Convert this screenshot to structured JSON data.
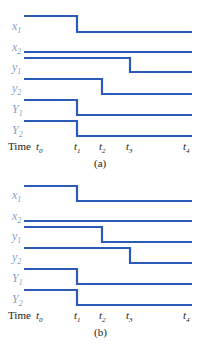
{
  "figure": {
    "line_color": "#2b5bb8",
    "label_color": "#8aa0c8",
    "time_axis_label": "Time",
    "time_ticks": [
      {
        "name": "t",
        "sub": "0",
        "x": 36
      },
      {
        "name": "t",
        "sub": "1",
        "x": 74
      },
      {
        "name": "t",
        "sub": "2",
        "x": 99
      },
      {
        "name": "t",
        "sub": "3",
        "x": 126
      },
      {
        "name": "t",
        "sub": "4",
        "x": 183
      }
    ],
    "x_start": 24,
    "x_end": 192,
    "t_positions": {
      "t1": 77,
      "t2": 102,
      "t3": 130
    }
  },
  "panels": [
    {
      "id": "a",
      "caption": "(a)",
      "top": 0,
      "signals": [
        {
          "label": "x",
          "sub": "1",
          "high_y": 16,
          "low_y": 32,
          "step_x": 77,
          "label_y": 20
        },
        {
          "label": "x",
          "sub": "2",
          "high_y": 52,
          "low_y": 52,
          "step_x": null,
          "label_y": 41
        },
        {
          "label": "y",
          "sub": "1",
          "high_y": 58,
          "low_y": 72,
          "step_x": 130,
          "label_y": 61
        },
        {
          "label": "y",
          "sub": "2",
          "high_y": 79,
          "low_y": 94,
          "step_x": 102,
          "label_y": 82
        },
        {
          "label": "Y",
          "sub": "1",
          "high_y": 100,
          "low_y": 115,
          "step_x": 77,
          "label_y": 103
        },
        {
          "label": "Y",
          "sub": "2",
          "high_y": 121,
          "low_y": 136,
          "step_x": 77,
          "label_y": 124
        }
      ],
      "time_y": 141,
      "caption_y": 158
    },
    {
      "id": "b",
      "caption": "(b)",
      "top": 0,
      "signals": [
        {
          "label": "x",
          "sub": "1",
          "high_y": 186,
          "low_y": 201,
          "step_x": 77,
          "label_y": 189
        },
        {
          "label": "x",
          "sub": "2",
          "high_y": 221,
          "low_y": 221,
          "step_x": null,
          "label_y": 210
        },
        {
          "label": "y",
          "sub": "1",
          "high_y": 227,
          "low_y": 242,
          "step_x": 102,
          "label_y": 230
        },
        {
          "label": "y",
          "sub": "2",
          "high_y": 248,
          "low_y": 263,
          "step_x": 130,
          "label_y": 251
        },
        {
          "label": "Y",
          "sub": "1",
          "high_y": 269,
          "low_y": 284,
          "step_x": 77,
          "label_y": 272
        },
        {
          "label": "Y",
          "sub": "2",
          "high_y": 290,
          "low_y": 305,
          "step_x": 77,
          "label_y": 293
        }
      ],
      "time_y": 310,
      "caption_y": 327
    }
  ]
}
